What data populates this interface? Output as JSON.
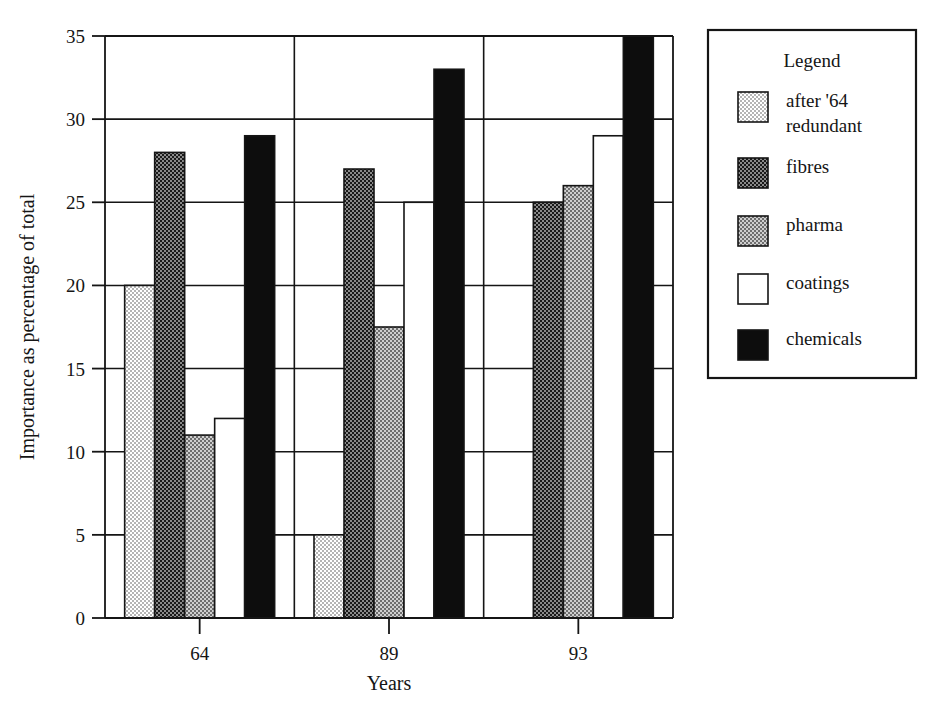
{
  "chart_data": {
    "type": "bar",
    "title": "",
    "xlabel": "Years",
    "ylabel": "Importance as percentage of total",
    "categories": [
      "64",
      "89",
      "93"
    ],
    "ylim": [
      0,
      35
    ],
    "ytick_values": [
      0,
      5,
      10,
      15,
      20,
      25,
      30,
      35
    ],
    "ytick_labels": [
      "0",
      "5",
      "10",
      "15",
      "20",
      "25",
      "30",
      "35"
    ],
    "xtick_labels": [
      "64",
      "89",
      "93"
    ],
    "grid": "horizontal-and-vertical",
    "legend_position": "right-outside",
    "legend_title": "Legend",
    "series": [
      {
        "name": "after '64\nredundant",
        "label_line1": "after '64",
        "label_line2": "redundant",
        "pattern": "light-checker",
        "values": [
          20,
          5,
          0
        ]
      },
      {
        "name": "fibres",
        "label_line1": "fibres",
        "label_line2": "",
        "pattern": "dark-checker",
        "values": [
          28,
          27,
          25
        ]
      },
      {
        "name": "pharma",
        "label_line1": "pharma",
        "label_line2": "",
        "pattern": "mid-checker",
        "values": [
          11,
          17.5,
          26
        ]
      },
      {
        "name": "coatings",
        "label_line1": "coatings",
        "label_line2": "",
        "pattern": "white",
        "values": [
          12,
          25,
          29
        ]
      },
      {
        "name": "chemicals",
        "label_line1": "chemicals",
        "label_line2": "",
        "pattern": "solid-black",
        "values": [
          29,
          33,
          35
        ]
      }
    ]
  },
  "colors": {
    "axis": "#151515",
    "grid": "#151515",
    "background": "#ffffff",
    "light_checker": "#d8d8d8",
    "mid_checker": "#a8a8a8",
    "dark_checker": "#3a3a3a",
    "solid_black": "#0d0d0d",
    "white": "#ffffff"
  }
}
